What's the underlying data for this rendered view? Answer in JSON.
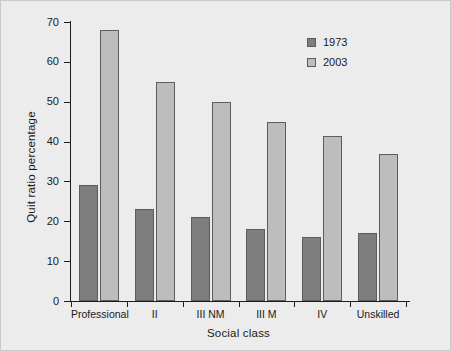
{
  "chart_data": {
    "type": "bar",
    "title": "",
    "subtitle": "",
    "xlabel": "Social class",
    "ylabel": "Quit ratio percentage",
    "categories": [
      "Professional",
      "II",
      "III NM",
      "III M",
      "IV",
      "Unskilled"
    ],
    "series": [
      {
        "name": "1973",
        "color": "#7e7e7e",
        "values": [
          29,
          23,
          21,
          18,
          16,
          17
        ]
      },
      {
        "name": "2003",
        "color": "#bdbdbd",
        "values": [
          68,
          55,
          50,
          45,
          41.5,
          37
        ]
      }
    ],
    "ylim": [
      0,
      70
    ],
    "yticks": [
      0,
      10,
      20,
      30,
      40,
      50,
      60,
      70
    ],
    "ytick_labels": [
      "0",
      "10",
      "20",
      "30",
      "40",
      "50",
      "60",
      "70"
    ],
    "grid": false,
    "legend_position": "top-right",
    "legend_entries": [
      "1973",
      "2003"
    ],
    "background_color": "#ececec",
    "axis_color": "#1c1c1c",
    "bar_border_color": "#5d5d5d"
  }
}
